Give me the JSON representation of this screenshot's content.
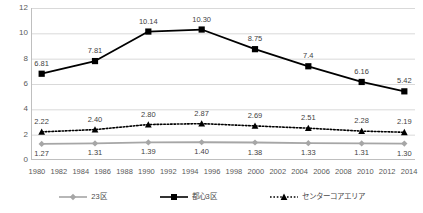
{
  "chart_data": {
    "type": "line",
    "title": "",
    "subtitle": "",
    "xlabel": "",
    "ylabel": "",
    "ylim": [
      0,
      12
    ],
    "yticks": [
      "0",
      "2",
      "4",
      "6",
      "8",
      "10",
      "12"
    ],
    "grid": true,
    "legend_position": "bottom",
    "x": [
      1980,
      1985,
      1990,
      1995,
      2000,
      2005,
      2010,
      2014
    ],
    "xtick_labels": [
      "1980",
      "1982",
      "1984",
      "1986",
      "1988",
      "1990",
      "1992",
      "1994",
      "1996",
      "1998",
      "2000",
      "2002",
      "2004",
      "2006",
      "2008",
      "2010",
      "2012",
      "2014"
    ],
    "xlim": [
      1979,
      2015
    ],
    "series": [
      {
        "name": "23区",
        "marker": "diamond",
        "line_style": "solid",
        "color": "#a6a6a6",
        "values": [
          1.27,
          1.31,
          1.39,
          1.4,
          1.38,
          1.33,
          1.31,
          1.3
        ],
        "labels": [
          "1.27",
          "1.31",
          "1.39",
          "1.40",
          "1.38",
          "1.33",
          "1.31",
          "1.30"
        ],
        "label_position": "below"
      },
      {
        "name": "都心3区",
        "marker": "square",
        "line_style": "solid",
        "color": "#000000",
        "values": [
          6.81,
          7.81,
          10.14,
          10.3,
          8.75,
          7.4,
          6.16,
          5.42
        ],
        "labels": [
          "6.81",
          "7.81",
          "10.14",
          "10.30",
          "8.75",
          "7.4",
          "6.16",
          "5.42"
        ],
        "label_position": "above"
      },
      {
        "name": "センターコアエリア",
        "marker": "triangle",
        "line_style": "dotted",
        "color": "#000000",
        "values": [
          2.22,
          2.4,
          2.8,
          2.87,
          2.69,
          2.51,
          2.28,
          2.19
        ],
        "labels": [
          "2.22",
          "2.40",
          "2.80",
          "2.87",
          "2.69",
          "2.51",
          "2.28",
          "2.19"
        ],
        "label_position": "above"
      }
    ],
    "colors": {
      "grid": "#d9d9d9",
      "axis": "#bfbfbf",
      "tick_text": "#595959",
      "label_text": "#3f3f3f",
      "series_gray": "#a6a6a6",
      "series_black": "#000000",
      "background": "#ffffff"
    }
  }
}
